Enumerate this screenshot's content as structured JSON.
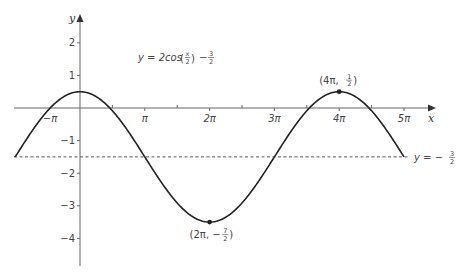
{
  "chart_data": {
    "type": "line",
    "equation_label": {
      "lhs": "y = 2cos",
      "frac_num": "x",
      "frac_den": "2",
      "minus": "−",
      "const_num": "3",
      "const_den": "2"
    },
    "xlabel": "x",
    "ylabel": "y",
    "x_range_pi": [
      -1,
      5
    ],
    "ylim": [
      -4.7,
      2.8
    ],
    "x_ticks": [
      {
        "value_pi": -1,
        "label": "−π"
      },
      {
        "value_pi": 1,
        "label": "π"
      },
      {
        "value_pi": 2,
        "label": "2π"
      },
      {
        "value_pi": 3,
        "label": "3π"
      },
      {
        "value_pi": 4,
        "label": "4π"
      },
      {
        "value_pi": 5,
        "label": "5π"
      }
    ],
    "x_minor_ticks_pi": [
      0.5,
      1.5,
      2.5,
      3.5,
      4.5
    ],
    "y_ticks": [
      {
        "value": 2,
        "label": "2"
      },
      {
        "value": 1,
        "label": "1"
      },
      {
        "value": -1,
        "label": "−1"
      },
      {
        "value": -2,
        "label": "−2"
      },
      {
        "value": -3,
        "label": "−3"
      },
      {
        "value": -4,
        "label": "−4"
      }
    ],
    "series": [
      {
        "name": "y = 2cos(x/2) − 3/2",
        "function": "2*cos(x/2) - 1.5",
        "x_start_pi": -1,
        "x_end_pi": 5,
        "style": "solid"
      }
    ],
    "asymptote": {
      "y": -1.5,
      "label_lhs": "y = −",
      "label_num": "3",
      "label_den": "2",
      "style": "dashed"
    },
    "annotations": [
      {
        "point": {
          "x_pi": 2,
          "y": -3.5
        },
        "label_lhs": "(2π, −",
        "label_num": "7",
        "label_den": "2",
        "label_rhs": ")"
      },
      {
        "point": {
          "x_pi": 4,
          "y": 0.5
        },
        "label_lhs": "(4π, ",
        "label_num": "1",
        "label_den": "2",
        "label_rhs": ")"
      }
    ],
    "grid": false,
    "legend": null
  },
  "colors": {
    "curve": "#222222",
    "axis": "#666666",
    "text": "#444444"
  }
}
